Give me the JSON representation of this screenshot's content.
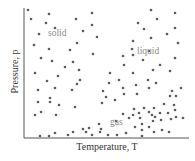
{
  "figure": {
    "xlabel": "Temperature, T",
    "ylabel": "Pressure, p",
    "regions": [
      {
        "label": "solid",
        "x": 48,
        "y": 34
      },
      {
        "label": "liquid",
        "x": 137,
        "y": 52
      },
      {
        "label": "gas",
        "x": 110,
        "y": 123
      }
    ],
    "colors": {
      "dot": "#5c5c5c",
      "axis": "#555555",
      "region_text": "#8a8a8a"
    }
  },
  "chart_data": {
    "type": "scatter",
    "title": "",
    "xlabel": "Temperature, T",
    "ylabel": "Pressure, p",
    "grid": false,
    "annotations": [
      "solid",
      "liquid",
      "gas"
    ],
    "note": "Points given in pixel coordinates (x right, y down) within the 195x161 figure; axes have no numeric ticks.",
    "points": [
      [
        28,
        10
      ],
      [
        31,
        19
      ],
      [
        49,
        14
      ],
      [
        46,
        23
      ],
      [
        39,
        34
      ],
      [
        55,
        28
      ],
      [
        76,
        19
      ],
      [
        92,
        13
      ],
      [
        92,
        25
      ],
      [
        83,
        31
      ],
      [
        97,
        37
      ],
      [
        34,
        45
      ],
      [
        49,
        49
      ],
      [
        41,
        58
      ],
      [
        52,
        61
      ],
      [
        70,
        50
      ],
      [
        77,
        43
      ],
      [
        73,
        62
      ],
      [
        35,
        73
      ],
      [
        65,
        67
      ],
      [
        58,
        76
      ],
      [
        79,
        70
      ],
      [
        93,
        54
      ],
      [
        47,
        81
      ],
      [
        38,
        90
      ],
      [
        55,
        88
      ],
      [
        72,
        90
      ],
      [
        80,
        80
      ],
      [
        77,
        84
      ],
      [
        38,
        102
      ],
      [
        50,
        98
      ],
      [
        50,
        102
      ],
      [
        59,
        105
      ],
      [
        35,
        115
      ],
      [
        41,
        112
      ],
      [
        56,
        115
      ],
      [
        75,
        107
      ],
      [
        151,
        10
      ],
      [
        157,
        19
      ],
      [
        175,
        13
      ],
      [
        138,
        23
      ],
      [
        144,
        29
      ],
      [
        175,
        28
      ],
      [
        133,
        41
      ],
      [
        151,
        38
      ],
      [
        167,
        34
      ],
      [
        178,
        43
      ],
      [
        132,
        49
      ],
      [
        123,
        56
      ],
      [
        133,
        55
      ],
      [
        143,
        60
      ],
      [
        149,
        51
      ],
      [
        175,
        58
      ],
      [
        124,
        65
      ],
      [
        133,
        73
      ],
      [
        160,
        65
      ],
      [
        153,
        70
      ],
      [
        110,
        73
      ],
      [
        119,
        80
      ],
      [
        109,
        83
      ],
      [
        136,
        85
      ],
      [
        148,
        80
      ],
      [
        156,
        83
      ],
      [
        170,
        71
      ],
      [
        181,
        88
      ],
      [
        123,
        88
      ],
      [
        103,
        91
      ],
      [
        106,
        97
      ],
      [
        115,
        100
      ],
      [
        124,
        94
      ],
      [
        137,
        94
      ],
      [
        149,
        88
      ],
      [
        172,
        91
      ],
      [
        102,
        103
      ],
      [
        134,
        109
      ],
      [
        144,
        108
      ],
      [
        154,
        108
      ],
      [
        164,
        104
      ],
      [
        170,
        96
      ],
      [
        174,
        105
      ],
      [
        176,
        96
      ],
      [
        123,
        114
      ],
      [
        133,
        115
      ],
      [
        139,
        113
      ],
      [
        140,
        118
      ],
      [
        149,
        112
      ],
      [
        152,
        115
      ],
      [
        155,
        117
      ],
      [
        160,
        113
      ],
      [
        168,
        113
      ],
      [
        175,
        110
      ],
      [
        183,
        118
      ],
      [
        116,
        121
      ],
      [
        129,
        118
      ],
      [
        142,
        124
      ],
      [
        153,
        121
      ],
      [
        161,
        120
      ],
      [
        171,
        119
      ],
      [
        176,
        117
      ],
      [
        99,
        124
      ],
      [
        101,
        129
      ],
      [
        89,
        128
      ],
      [
        83,
        129
      ],
      [
        86,
        132
      ],
      [
        73,
        132
      ],
      [
        92,
        135
      ],
      [
        100,
        132
      ],
      [
        108,
        135
      ],
      [
        117,
        135
      ],
      [
        126,
        133
      ],
      [
        135,
        127
      ],
      [
        142,
        130
      ],
      [
        149,
        127
      ],
      [
        154,
        132
      ],
      [
        162,
        130
      ],
      [
        169,
        132
      ],
      [
        142,
        136
      ],
      [
        40,
        136
      ],
      [
        49,
        136
      ],
      [
        55,
        133
      ],
      [
        68,
        135
      ]
    ]
  }
}
